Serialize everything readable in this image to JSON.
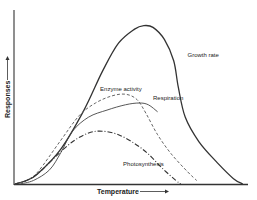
{
  "chart_data": {
    "type": "line",
    "title": "",
    "xlabel": "Temperature",
    "ylabel": "Responses",
    "xlim": [
      0,
      1
    ],
    "ylim": [
      0,
      1
    ],
    "grid": false,
    "legend": "inline-labels",
    "x_ticks": [],
    "y_ticks": [],
    "series": [
      {
        "name": "Growth rate",
        "style": "solid",
        "color": "#333333",
        "points": [
          [
            0,
            0
          ],
          [
            0.05,
            0.02
          ],
          [
            0.1,
            0.06
          ],
          [
            0.2,
            0.2
          ],
          [
            0.3,
            0.42
          ],
          [
            0.38,
            0.64
          ],
          [
            0.45,
            0.8
          ],
          [
            0.52,
            0.88
          ],
          [
            0.56,
            0.9
          ],
          [
            0.6,
            0.89
          ],
          [
            0.65,
            0.82
          ],
          [
            0.69,
            0.7
          ],
          [
            0.71,
            0.55
          ],
          [
            0.74,
            0.38
          ],
          [
            0.8,
            0.24
          ],
          [
            0.88,
            0.12
          ],
          [
            0.95,
            0.03
          ],
          [
            0.99,
            0
          ]
        ]
      },
      {
        "name": "Enzyme activity",
        "style": "dashed",
        "color": "#555555",
        "points": [
          [
            0,
            0
          ],
          [
            0.05,
            0.02
          ],
          [
            0.1,
            0.07
          ],
          [
            0.2,
            0.25
          ],
          [
            0.28,
            0.39
          ],
          [
            0.35,
            0.46
          ],
          [
            0.42,
            0.5
          ],
          [
            0.48,
            0.51
          ],
          [
            0.53,
            0.48
          ],
          [
            0.57,
            0.4
          ],
          [
            0.62,
            0.28
          ],
          [
            0.68,
            0.17
          ],
          [
            0.75,
            0.07
          ],
          [
            0.79,
            0.02
          ]
        ]
      },
      {
        "name": "Respiration",
        "style": "solid",
        "color": "#444444",
        "points": [
          [
            0.02,
            0
          ],
          [
            0.08,
            0.02
          ],
          [
            0.15,
            0.08
          ],
          [
            0.2,
            0.18
          ],
          [
            0.25,
            0.3
          ],
          [
            0.32,
            0.38
          ],
          [
            0.4,
            0.42
          ],
          [
            0.48,
            0.45
          ],
          [
            0.54,
            0.46
          ],
          [
            0.58,
            0.45
          ],
          [
            0.62,
            0.41
          ]
        ]
      },
      {
        "name": "Photosynthesis",
        "style": "dash-dot",
        "color": "#333333",
        "points": [
          [
            0,
            0
          ],
          [
            0.05,
            0.02
          ],
          [
            0.1,
            0.06
          ],
          [
            0.18,
            0.16
          ],
          [
            0.25,
            0.24
          ],
          [
            0.32,
            0.29
          ],
          [
            0.38,
            0.3
          ],
          [
            0.45,
            0.28
          ],
          [
            0.52,
            0.23
          ],
          [
            0.58,
            0.17
          ],
          [
            0.64,
            0.09
          ],
          [
            0.7,
            0.02
          ],
          [
            0.72,
            0
          ]
        ]
      }
    ],
    "annotations": [
      {
        "text": "Growth rate",
        "x": 0.75,
        "y": 0.72
      },
      {
        "text": "Enzyme activity",
        "x": 0.37,
        "y": 0.53
      },
      {
        "text": "Respiration",
        "x": 0.6,
        "y": 0.48
      },
      {
        "text": "Photosynthesis",
        "x": 0.47,
        "y": 0.1
      }
    ]
  },
  "axes": {
    "x_label": "Temperature",
    "y_label": "Responses"
  }
}
